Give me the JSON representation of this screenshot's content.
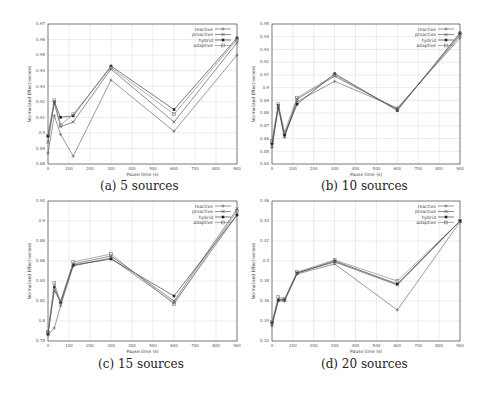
{
  "chart_data": [
    {
      "type": "line",
      "caption": "(a) 5 sources",
      "xlabel": "Pause time (s)",
      "ylabel": "Normalized Effectiveness",
      "x": [
        0,
        30,
        60,
        120,
        300,
        600,
        900
      ],
      "xticks": [
        0,
        100,
        200,
        300,
        400,
        500,
        600,
        700,
        800,
        900
      ],
      "yticks": [
        0.88,
        0.89,
        0.9,
        0.91,
        0.92,
        0.93,
        0.94,
        0.95,
        0.96,
        0.97
      ],
      "ytick_labels": [
        "0.88",
        "0.89",
        "0.9",
        "0.91",
        "0.92",
        "0.93",
        "0.94",
        "0.95",
        "0.96",
        "0.97"
      ],
      "ylim": [
        0.88,
        0.97
      ],
      "xlim": [
        0,
        900
      ],
      "grid": true,
      "legend_position": "top-right",
      "series": [
        {
          "name": "reactive",
          "values": [
            0.887,
            0.911,
            0.899,
            0.885,
            0.934,
            0.901,
            0.95
          ]
        },
        {
          "name": "proactive",
          "values": [
            0.894,
            0.919,
            0.904,
            0.907,
            0.941,
            0.907,
            0.958
          ]
        },
        {
          "name": "hybrid",
          "values": [
            0.898,
            0.92,
            0.91,
            0.911,
            0.943,
            0.915,
            0.961
          ]
        },
        {
          "name": "adaptive",
          "values": [
            0.898,
            0.921,
            0.905,
            0.912,
            0.942,
            0.912,
            0.96
          ]
        }
      ]
    },
    {
      "type": "line",
      "caption": "(b) 10 sources",
      "xlabel": "Pause time (s)",
      "ylabel": "Normalized Effectiveness",
      "x": [
        0,
        30,
        60,
        120,
        300,
        600,
        900
      ],
      "xticks": [
        0,
        100,
        200,
        300,
        400,
        500,
        600,
        700,
        800,
        900
      ],
      "yticks": [
        0.84,
        0.85,
        0.86,
        0.87,
        0.88,
        0.89,
        0.9,
        0.91,
        0.92,
        0.93,
        0.94,
        0.95
      ],
      "ytick_labels": [
        "0.84",
        "0.85",
        "0.86",
        "0.87",
        "0.88",
        "0.89",
        "0.9",
        "0.91",
        "0.92",
        "0.93",
        "0.94",
        "0.95"
      ],
      "ylim": [
        0.84,
        0.95
      ],
      "xlim": [
        0,
        900
      ],
      "grid": true,
      "legend_position": "top-right",
      "series": [
        {
          "name": "reactive",
          "values": [
            0.853,
            0.884,
            0.861,
            0.889,
            0.905,
            0.884,
            0.939
          ]
        },
        {
          "name": "proactive",
          "values": [
            0.855,
            0.885,
            0.862,
            0.891,
            0.909,
            0.883,
            0.941
          ]
        },
        {
          "name": "hybrid",
          "values": [
            0.856,
            0.886,
            0.863,
            0.887,
            0.911,
            0.882,
            0.943
          ]
        },
        {
          "name": "adaptive",
          "values": [
            0.858,
            0.887,
            0.865,
            0.892,
            0.91,
            0.883,
            0.942
          ]
        }
      ]
    },
    {
      "type": "line",
      "caption": "(c) 15 sources",
      "xlabel": "Pause time (s)",
      "ylabel": "Normalized Effectiveness",
      "x": [
        0,
        30,
        60,
        120,
        300,
        600,
        900
      ],
      "xticks": [
        0,
        100,
        200,
        300,
        400,
        500,
        600,
        700,
        800,
        900
      ],
      "yticks": [
        0.78,
        0.8,
        0.82,
        0.84,
        0.86,
        0.88,
        0.9,
        0.92
      ],
      "ytick_labels": [
        "0.78",
        "0.8",
        "0.82",
        "0.84",
        "0.86",
        "0.88",
        "0.9",
        "0.92"
      ],
      "ylim": [
        0.78,
        0.92
      ],
      "xlim": [
        0,
        900
      ],
      "grid": true,
      "legend_position": "top-right",
      "series": [
        {
          "name": "reactive",
          "values": [
            0.786,
            0.793,
            0.815,
            0.855,
            0.863,
            0.818,
            0.906
          ]
        },
        {
          "name": "proactive",
          "values": [
            0.788,
            0.83,
            0.82,
            0.857,
            0.865,
            0.82,
            0.912
          ]
        },
        {
          "name": "hybrid",
          "values": [
            0.787,
            0.834,
            0.818,
            0.856,
            0.862,
            0.825,
            0.906
          ]
        },
        {
          "name": "adaptive",
          "values": [
            0.789,
            0.838,
            0.819,
            0.859,
            0.867,
            0.817,
            0.91
          ]
        }
      ]
    },
    {
      "type": "line",
      "caption": "(d) 20 sources",
      "xlabel": "Pause time (s)",
      "ylabel": "Normalized Effectiveness",
      "x": [
        0,
        30,
        60,
        120,
        300,
        600,
        900
      ],
      "xticks": [
        0,
        100,
        200,
        300,
        400,
        500,
        600,
        700,
        800,
        900
      ],
      "yticks": [
        0.32,
        0.34,
        0.36,
        0.38,
        0.4,
        0.42,
        0.44,
        0.46
      ],
      "ytick_labels": [
        "0.32",
        "0.34",
        "0.36",
        "0.38",
        "0.4",
        "0.42",
        "0.44",
        "0.46"
      ],
      "ylim": [
        0.32,
        0.46
      ],
      "xlim": [
        0,
        900
      ],
      "grid": true,
      "legend_position": "top-right",
      "series": [
        {
          "name": "reactive",
          "values": [
            0.335,
            0.36,
            0.36,
            0.387,
            0.397,
            0.351,
            0.439
          ]
        },
        {
          "name": "proactive",
          "values": [
            0.337,
            0.362,
            0.361,
            0.388,
            0.399,
            0.376,
            0.44
          ]
        },
        {
          "name": "hybrid",
          "values": [
            0.338,
            0.361,
            0.361,
            0.388,
            0.4,
            0.377,
            0.44
          ]
        },
        {
          "name": "adaptive",
          "values": [
            0.339,
            0.364,
            0.362,
            0.389,
            0.401,
            0.38,
            0.44
          ]
        }
      ]
    }
  ],
  "style": {
    "series_colors": [
      "#555555",
      "#444444",
      "#222222",
      "#777777"
    ],
    "series_markers": [
      "plus",
      "cross",
      "star",
      "square"
    ],
    "grid_color": "#cfcfcf",
    "axis_color": "#333333"
  }
}
